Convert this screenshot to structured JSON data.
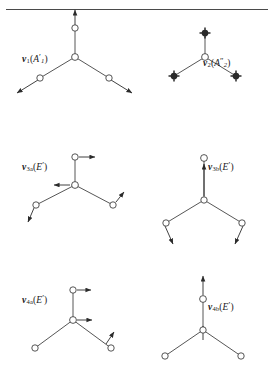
{
  "figure": {
    "kind": "normal-mode-vibration-diagram",
    "molecule_type": "planar-XY3",
    "has_top_rule": true,
    "stroke_color": "#2b2b2b",
    "background_color": "#ffffff",
    "width": 274,
    "height": 368
  },
  "panels": [
    {
      "id": "v1",
      "label": {
        "v": "v",
        "sub": "1",
        "open": "(",
        "sym": "A",
        "prime": "′",
        "symsub": "1",
        "close": ")"
      },
      "label_text": "v1(A'1)",
      "label_x": 22,
      "label_y": 52,
      "atom_style": "open-circle",
      "description": "symmetric stretch, all three outer atoms move outward along bonds",
      "arrows": [
        "up",
        "down-left",
        "down-right"
      ]
    },
    {
      "id": "v2",
      "label": {
        "v": "v",
        "sub": "2",
        "open": "(",
        "sym": "A",
        "prime": "″",
        "symsub": "2",
        "close": ")"
      },
      "label_text": "v2(A''2)",
      "label_x": 203,
      "label_y": 56,
      "atom_style": "crossed-circle",
      "description": "out-of-plane bend, outer atoms move perpendicular to plane",
      "arrows": [
        "out-of-plane",
        "out-of-plane",
        "out-of-plane"
      ]
    },
    {
      "id": "v3a",
      "label": {
        "v": "v",
        "sub": "3a",
        "open": "(",
        "sym": "E",
        "prime": "′",
        "symsub": "",
        "close": ")"
      },
      "label_text": "v3a(E')",
      "label_x": 22,
      "label_y": 160,
      "atom_style": "open-circle",
      "description": "degenerate stretch component a",
      "arrows": [
        "right",
        "left",
        "down-left",
        "up-right"
      ]
    },
    {
      "id": "v3b",
      "label": {
        "v": "v",
        "sub": "3b",
        "open": "(",
        "sym": "E",
        "prime": "′",
        "symsub": "",
        "close": ")"
      },
      "label_text": "v3b(E')",
      "label_x": 208,
      "label_y": 160,
      "atom_style": "open-circle",
      "description": "degenerate stretch component b",
      "arrows": [
        "up",
        "down-left",
        "down-right"
      ]
    },
    {
      "id": "v4a",
      "label": {
        "v": "v",
        "sub": "4a",
        "open": "(",
        "sym": "E",
        "prime": "′",
        "symsub": "",
        "close": ")"
      },
      "label_text": "v4a(E')",
      "label_x": 22,
      "label_y": 293,
      "atom_style": "open-circle",
      "description": "degenerate bend component a",
      "arrows": [
        "right",
        "right",
        "up-right"
      ]
    },
    {
      "id": "v4b",
      "label": {
        "v": "v",
        "sub": "4b",
        "open": "(",
        "sym": "E",
        "prime": "′",
        "symsub": "",
        "close": ")"
      },
      "label_text": "v4b(E')",
      "label_x": 208,
      "label_y": 300,
      "atom_style": "open-circle",
      "description": "degenerate bend component b",
      "arrows": [
        "up",
        "up"
      ]
    }
  ]
}
